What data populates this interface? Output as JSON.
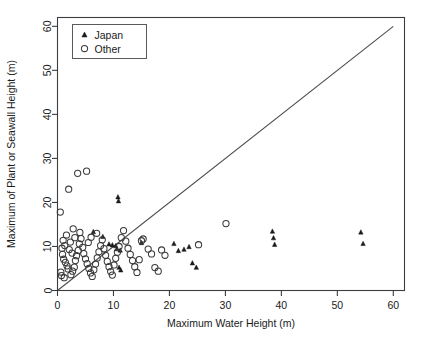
{
  "chart_data": {
    "type": "scatter",
    "title": "",
    "xlabel": "Maximum Water Height (m)",
    "ylabel": "Maximum of Plant or Seawall Height (m)",
    "xlim": [
      0,
      62
    ],
    "ylim": [
      0,
      62
    ],
    "xticks": [
      0,
      10,
      20,
      30,
      40,
      50,
      60
    ],
    "yticks": [
      0,
      10,
      20,
      30,
      40,
      50,
      60
    ],
    "xtick_labels": [
      "0",
      "10",
      "20",
      "30",
      "40",
      "50",
      "60"
    ],
    "ytick_labels": [
      "0",
      "10",
      "20",
      "30",
      "40",
      "50",
      "60"
    ],
    "grid": false,
    "legend_position": "top-left",
    "reference_line": {
      "name": "identity-line",
      "equation": "y = x",
      "from": [
        0,
        0
      ],
      "to": [
        60,
        60
      ]
    },
    "series": [
      {
        "name": "Japan",
        "marker": "filled-triangle",
        "color": "#1b1b1b",
        "points": [
          [
            10.8,
            21.2
          ],
          [
            10.9,
            20.3
          ],
          [
            6.4,
            13.3
          ],
          [
            8.1,
            12.2
          ],
          [
            9.2,
            10.5
          ],
          [
            9.8,
            10.3
          ],
          [
            10.4,
            10.1
          ],
          [
            10.6,
            9.4
          ],
          [
            11.2,
            9.1
          ],
          [
            11.0,
            5.2
          ],
          [
            11.3,
            4.6
          ],
          [
            15.0,
            10.8
          ],
          [
            20.8,
            10.6
          ],
          [
            21.6,
            9.0
          ],
          [
            22.6,
            9.3
          ],
          [
            23.5,
            9.9
          ],
          [
            24.1,
            6.2
          ],
          [
            24.8,
            5.2
          ],
          [
            38.4,
            13.4
          ],
          [
            38.6,
            11.9
          ],
          [
            38.8,
            10.4
          ],
          [
            54.2,
            13.2
          ],
          [
            54.6,
            10.6
          ]
        ]
      },
      {
        "name": "Other",
        "marker": "open-circle",
        "color": "#3a3a3a",
        "points": [
          [
            0.5,
            17.8
          ],
          [
            2.0,
            23.0
          ],
          [
            3.6,
            26.6
          ],
          [
            5.2,
            27.1
          ],
          [
            1.0,
            11.4
          ],
          [
            1.3,
            10.2
          ],
          [
            1.6,
            12.6
          ],
          [
            2.1,
            9.3
          ],
          [
            2.3,
            11.0
          ],
          [
            2.6,
            8.5
          ],
          [
            0.8,
            9.6
          ],
          [
            0.9,
            8.2
          ],
          [
            1.1,
            7.1
          ],
          [
            1.4,
            6.4
          ],
          [
            1.7,
            5.6
          ],
          [
            1.9,
            4.9
          ],
          [
            0.6,
            4.2
          ],
          [
            0.7,
            3.4
          ],
          [
            1.2,
            2.9
          ],
          [
            2.4,
            3.6
          ],
          [
            2.7,
            4.4
          ],
          [
            3.0,
            5.3
          ],
          [
            3.2,
            6.8
          ],
          [
            3.4,
            7.9
          ],
          [
            3.7,
            9.1
          ],
          [
            3.9,
            10.6
          ],
          [
            4.2,
            11.8
          ],
          [
            4.5,
            9.8
          ],
          [
            4.7,
            8.4
          ],
          [
            5.0,
            7.2
          ],
          [
            5.3,
            6.1
          ],
          [
            5.6,
            5.0
          ],
          [
            5.9,
            4.0
          ],
          [
            6.2,
            3.2
          ],
          [
            6.5,
            4.7
          ],
          [
            6.8,
            6.0
          ],
          [
            7.1,
            7.4
          ],
          [
            7.4,
            8.8
          ],
          [
            7.7,
            10.2
          ],
          [
            8.0,
            11.5
          ],
          [
            8.3,
            9.5
          ],
          [
            8.6,
            8.0
          ],
          [
            8.9,
            6.6
          ],
          [
            9.2,
            5.4
          ],
          [
            9.5,
            4.3
          ],
          [
            9.8,
            3.5
          ],
          [
            10.1,
            5.8
          ],
          [
            10.4,
            7.3
          ],
          [
            10.7,
            8.7
          ],
          [
            11.0,
            10.0
          ],
          [
            11.4,
            12.0
          ],
          [
            11.8,
            13.6
          ],
          [
            12.2,
            11.2
          ],
          [
            12.6,
            9.6
          ],
          [
            13.0,
            8.2
          ],
          [
            13.4,
            6.8
          ],
          [
            13.8,
            5.4
          ],
          [
            14.2,
            4.1
          ],
          [
            14.6,
            7.0
          ],
          [
            15.0,
            11.3
          ],
          [
            15.3,
            11.7
          ],
          [
            16.2,
            9.4
          ],
          [
            16.8,
            8.3
          ],
          [
            17.4,
            5.2
          ],
          [
            18.0,
            4.4
          ],
          [
            18.6,
            9.2
          ],
          [
            19.2,
            8.0
          ],
          [
            25.2,
            10.4
          ],
          [
            30.1,
            15.2
          ],
          [
            2.8,
            14.0
          ],
          [
            4.0,
            13.2
          ],
          [
            6.0,
            12.1
          ],
          [
            7.0,
            13.0
          ],
          [
            5.5,
            10.9
          ],
          [
            3.1,
            12.0
          ]
        ]
      }
    ]
  },
  "legend": {
    "items": [
      {
        "label": "Japan",
        "marker": "filled-triangle"
      },
      {
        "label": "Other",
        "marker": "open-circle"
      }
    ]
  }
}
